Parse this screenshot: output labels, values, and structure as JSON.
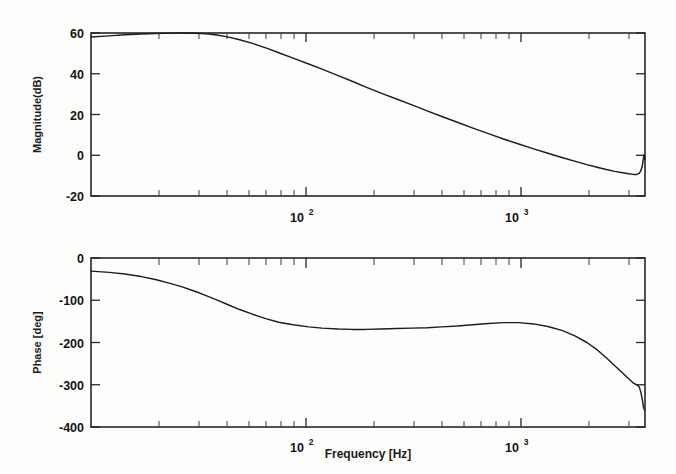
{
  "figure": {
    "kind": "bode-plot",
    "background_color": "#fdfdfb",
    "ink_color": "#1d1d1d",
    "xlabel": "Frequency [Hz]",
    "x_tick_labels": [
      "10",
      "10"
    ],
    "x_tick_exponents": [
      "2",
      "3"
    ],
    "panels": [
      {
        "name": "magnitude",
        "ylabel": "Magnitude(dB)"
      },
      {
        "name": "phase",
        "ylabel": "Phase [deg]"
      }
    ]
  },
  "chart_data": [
    {
      "type": "line",
      "title": "",
      "panel": "magnitude",
      "xlabel": "",
      "ylabel": "Magnitude(dB)",
      "xscale": "log",
      "xlim": [
        20,
        5000
      ],
      "ylim": [
        -20,
        60
      ],
      "yticks": [
        -20,
        0,
        20,
        40,
        60
      ],
      "ytick_labels": [
        "-20",
        "0",
        "20",
        "40",
        "60"
      ],
      "xticks": [
        100,
        1000
      ],
      "xtick_labels": [
        "10^2",
        "10^3"
      ],
      "grid": false,
      "legend": "none",
      "series": [
        {
          "name": "magnitude",
          "x": [
            20,
            24,
            28,
            33,
            38,
            44,
            50,
            57,
            63,
            70,
            78,
            88,
            100,
            115,
            130,
            150,
            175,
            200,
            235,
            270,
            310,
            360,
            420,
            490,
            570,
            660,
            770,
            900,
            1050,
            1220,
            1420,
            1650,
            1900,
            2200,
            2500,
            2800,
            3100,
            3400,
            3700,
            4000,
            4250,
            4450,
            4600,
            4720,
            4800,
            4870,
            4920,
            4960,
            5000
          ],
          "y": [
            58.0,
            58.6,
            59.1,
            59.5,
            59.8,
            59.95,
            60.0,
            59.9,
            59.6,
            59.0,
            58.1,
            56.7,
            54.9,
            52.6,
            50.3,
            47.7,
            44.8,
            42.3,
            39.1,
            36.3,
            33.4,
            30.5,
            27.6,
            24.7,
            21.8,
            19.0,
            16.2,
            13.3,
            10.6,
            8.0,
            5.5,
            3.1,
            1.0,
            -1.2,
            -3.0,
            -4.6,
            -5.9,
            -7.0,
            -7.9,
            -8.6,
            -9.1,
            -9.4,
            -9.4,
            -8.9,
            -7.6,
            -5.0,
            -1.6,
            0.3,
            -2.0
          ]
        }
      ]
    },
    {
      "type": "line",
      "title": "",
      "panel": "phase",
      "xlabel": "Frequency [Hz]",
      "ylabel": "Phase [deg]",
      "xscale": "log",
      "xlim": [
        20,
        5000
      ],
      "ylim": [
        -400,
        0
      ],
      "yticks": [
        -400,
        -300,
        -200,
        -100,
        0
      ],
      "ytick_labels": [
        "-400",
        "-300",
        "-200",
        "-100",
        "0"
      ],
      "xticks": [
        100,
        1000
      ],
      "xtick_labels": [
        "10^2",
        "10^3"
      ],
      "grid": false,
      "legend": "none",
      "series": [
        {
          "name": "phase",
          "x": [
            20,
            24,
            28,
            33,
            38,
            44,
            50,
            57,
            63,
            70,
            78,
            88,
            100,
            115,
            130,
            150,
            175,
            200,
            235,
            270,
            310,
            360,
            420,
            490,
            570,
            660,
            770,
            900,
            1050,
            1220,
            1420,
            1650,
            1900,
            2200,
            2500,
            2800,
            3100,
            3400,
            3700,
            4000,
            4250,
            4450,
            4600,
            4720,
            4800,
            4870,
            4920,
            4960,
            5000
          ],
          "y": [
            -31,
            -34,
            -38,
            -44,
            -51,
            -60,
            -69,
            -80,
            -89,
            -99,
            -110,
            -122,
            -133,
            -144,
            -152,
            -158,
            -163,
            -166,
            -168,
            -169,
            -169,
            -168,
            -167,
            -166,
            -165,
            -163,
            -161,
            -158,
            -155,
            -153,
            -153,
            -156,
            -162,
            -172,
            -185,
            -200,
            -217,
            -236,
            -255,
            -272,
            -286,
            -296,
            -300,
            -305,
            -318,
            -336,
            -352,
            -358,
            -360
          ]
        }
      ]
    }
  ]
}
